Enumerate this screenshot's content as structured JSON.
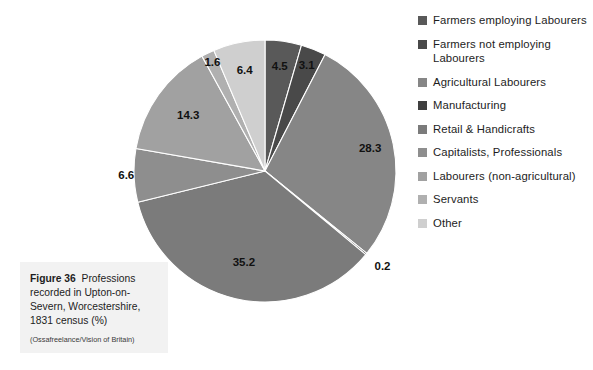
{
  "chart_data": {
    "type": "pie",
    "title": "Professions recorded in Upton-on-Severn, Worcestershire, 1831 census (%)",
    "units": "%",
    "legend_position": "right",
    "start_angle_deg": 0,
    "direction": "clockwise",
    "categories": [
      "Farmers employing Labourers",
      "Farmers not employing Labourers",
      "Agricultural Labourers",
      "Manufacturing",
      "Retail & Handicrafts",
      "Capitalists, Professionals",
      "Labourers (non-agricultural)",
      "Servants",
      "Other"
    ],
    "values": [
      4.5,
      3.1,
      28.3,
      0.2,
      35.2,
      6.6,
      14.3,
      1.6,
      6.4
    ],
    "labels": [
      "4.5",
      "3.1",
      "28.3",
      "0.2",
      "35.2",
      "6.6",
      "14.3",
      "1.6",
      "6.4"
    ],
    "colors": [
      "#595959",
      "#494949",
      "#868686",
      "#3f3f3f",
      "#7b7b7b",
      "#8e8e8e",
      "#a1a1a1",
      "#b0b0b0",
      "#cfcfcf"
    ]
  },
  "legend": {
    "items": [
      {
        "label": "Farmers employing Labourers",
        "color": "#595959"
      },
      {
        "label": "Farmers not employing Labourers",
        "color": "#494949"
      },
      {
        "label": "Agricultural Labourers",
        "color": "#868686"
      },
      {
        "label": "Manufacturing",
        "color": "#3f3f3f"
      },
      {
        "label": "Retail & Handicrafts",
        "color": "#7b7b7b"
      },
      {
        "label": "Capitalists,  Professionals",
        "color": "#8e8e8e"
      },
      {
        "label": "Labourers (non-agricultural)",
        "color": "#a1a1a1"
      },
      {
        "label": "Servants",
        "color": "#b0b0b0"
      },
      {
        "label": "Other",
        "color": "#cfcfcf"
      }
    ]
  },
  "caption": {
    "figure_number": "Figure 36",
    "text": "Professions recorded in Upton-on-Severn, Worcestershire, 1831 census (%)",
    "credit": "(Ossafreelance/Vision of Britain)"
  }
}
